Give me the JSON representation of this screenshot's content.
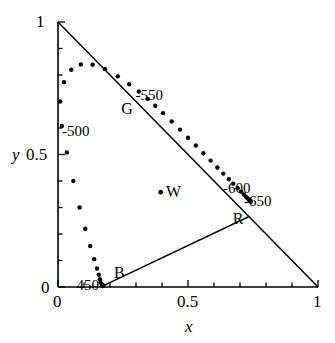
{
  "chart_data": {
    "type": "scatter",
    "title": "",
    "xlabel": "x",
    "ylabel": "y",
    "xlim": [
      0,
      1
    ],
    "ylim": [
      0,
      1
    ],
    "grid": false,
    "legend": "none",
    "x_ticks": [
      {
        "value": 0,
        "label": "0"
      },
      {
        "value": 0.5,
        "label": "0.5"
      },
      {
        "value": 1,
        "label": "1"
      }
    ],
    "y_ticks": [
      {
        "value": 0,
        "label": "0"
      },
      {
        "value": 0.5,
        "label": "0.5"
      },
      {
        "value": 1,
        "label": "1"
      }
    ],
    "x_minor_step": 0.1,
    "y_minor_step": 0.1,
    "series": [
      {
        "name": "spectral-locus",
        "type": "scatter",
        "marker": "dot",
        "points": [
          [
            0.175,
            0.005
          ],
          [
            0.173,
            0.004
          ],
          [
            0.172,
            0.005
          ],
          [
            0.17,
            0.007
          ],
          [
            0.168,
            0.011
          ],
          [
            0.164,
            0.018
          ],
          [
            0.161,
            0.029
          ],
          [
            0.157,
            0.046
          ],
          [
            0.15,
            0.07
          ],
          [
            0.139,
            0.105
          ],
          [
            0.124,
            0.155
          ],
          [
            0.105,
            0.22
          ],
          [
            0.083,
            0.3
          ],
          [
            0.059,
            0.4
          ],
          [
            0.034,
            0.508
          ],
          [
            0.015,
            0.608
          ],
          [
            0.008,
            0.7
          ],
          [
            0.023,
            0.773
          ],
          [
            0.051,
            0.82
          ],
          [
            0.088,
            0.84
          ],
          [
            0.133,
            0.839
          ],
          [
            0.181,
            0.822
          ],
          [
            0.23,
            0.795
          ],
          [
            0.274,
            0.765
          ],
          [
            0.311,
            0.738
          ],
          [
            0.345,
            0.71
          ],
          [
            0.374,
            0.684
          ],
          [
            0.404,
            0.656
          ],
          [
            0.437,
            0.625
          ],
          [
            0.469,
            0.594
          ],
          [
            0.5,
            0.563
          ],
          [
            0.53,
            0.534
          ],
          [
            0.559,
            0.505
          ],
          [
            0.587,
            0.477
          ],
          [
            0.613,
            0.451
          ],
          [
            0.636,
            0.428
          ],
          [
            0.657,
            0.407
          ],
          [
            0.674,
            0.39
          ],
          [
            0.691,
            0.373
          ],
          [
            0.704,
            0.36
          ],
          [
            0.715,
            0.349
          ],
          [
            0.723,
            0.341
          ],
          [
            0.729,
            0.335
          ],
          [
            0.733,
            0.331
          ],
          [
            0.736,
            0.328
          ],
          [
            0.738,
            0.326
          ],
          [
            0.74,
            0.324
          ],
          [
            0.7405,
            0.3235
          ],
          [
            0.7406,
            0.3234
          ]
        ]
      }
    ],
    "lines": [
      {
        "name": "x-plus-y-equals-1",
        "from": [
          0,
          1
        ],
        "to": [
          1,
          0
        ]
      },
      {
        "name": "purple-line-B-to-R",
        "from": [
          0.175,
          0.005
        ],
        "to": [
          0.733,
          0.265
        ]
      }
    ],
    "annotations": [
      {
        "name": "wavelength-450",
        "text": "450-",
        "x": 0.175,
        "y": 0.005,
        "anchor": "right"
      },
      {
        "name": "wavelength-500",
        "text": "-500",
        "x": 0.015,
        "y": 0.585,
        "anchor": "left"
      },
      {
        "name": "wavelength-550",
        "text": "-550",
        "x": 0.298,
        "y": 0.72,
        "anchor": "left"
      },
      {
        "name": "wavelength-600",
        "text": "-600",
        "x": 0.635,
        "y": 0.37,
        "anchor": "left"
      },
      {
        "name": "wavelength-650",
        "text": "-650",
        "x": 0.715,
        "y": 0.32,
        "anchor": "left"
      },
      {
        "name": "primary-G",
        "text": "G",
        "x": 0.243,
        "y": 0.67,
        "anchor": "left"
      },
      {
        "name": "primary-R",
        "text": "R",
        "x": 0.672,
        "y": 0.255,
        "anchor": "left"
      },
      {
        "name": "primary-B",
        "text": "B",
        "x": 0.215,
        "y": 0.052,
        "anchor": "left"
      },
      {
        "name": "white-point-W",
        "text": "W",
        "x": 0.415,
        "y": 0.36,
        "anchor": "left"
      }
    ],
    "marked_points": [
      {
        "name": "white-point",
        "label": "W",
        "x": 0.395,
        "y": 0.358
      }
    ]
  },
  "axes": {
    "x_title": "x",
    "y_title": "y",
    "x_tick_labels": [
      "0",
      "0.5",
      "1"
    ],
    "y_tick_labels": [
      "0",
      "0.5",
      "1"
    ]
  },
  "colors": {
    "ink": "#000000",
    "background": "#ffffff"
  }
}
